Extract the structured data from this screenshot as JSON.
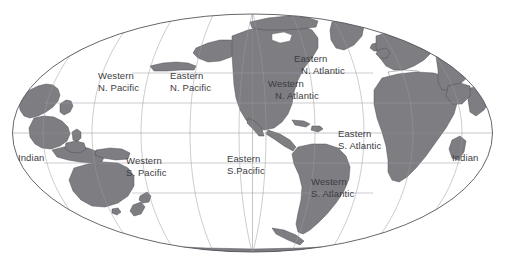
{
  "figure": {
    "type": "world-map",
    "projection": "mollweide-elliptical",
    "center_longitude_deg": -150,
    "background_color": "#ffffff",
    "land_color": "#7d7d82",
    "land_outline_color": "#4a4a50",
    "graticule_color": "#9a9aa0",
    "ellipse_outline_color": "#55555c",
    "label_color": "#3c3c41",
    "graticule": {
      "longitude_step_deg": 30,
      "latitude_step_deg": 30,
      "latitudes": [
        -60,
        -30,
        0,
        30,
        60
      ],
      "longitudes": [
        -180,
        -150,
        -120,
        -90,
        -60,
        -30,
        0,
        30,
        60,
        90,
        120,
        150,
        180
      ]
    }
  },
  "labels": [
    {
      "id": "western-n-pacific",
      "name": "Western N. Pacific",
      "line1": "Western",
      "line2": "N. Pacific",
      "x": 98,
      "y": 70
    },
    {
      "id": "eastern-n-pacific",
      "name": "Eastern N. Pacific",
      "line1": "Eastern",
      "line2": "N. Pacific",
      "x": 170,
      "y": 70
    },
    {
      "id": "eastern-n-atlantic",
      "name": "Eastern N. Atlantic",
      "line1": "Eastern",
      "line2": "N. Atlantic",
      "x": 294,
      "y": 53
    },
    {
      "id": "western-n-atlantic",
      "name": "Western N. Atlantic",
      "line1": "Western",
      "line2": "N. Atlantic",
      "x": 268,
      "y": 78
    },
    {
      "id": "indian-west",
      "name": "Indian",
      "line1": "Indian",
      "line2": "",
      "x": 18,
      "y": 152
    },
    {
      "id": "western-s-pacific",
      "name": "Western S. Pacific",
      "line1": "Western",
      "line2": "S. Pacific",
      "x": 126,
      "y": 155
    },
    {
      "id": "eastern-s-pacific",
      "name": "Eastern S.Pacific",
      "line1": "Eastern",
      "line2": "S.Pacific",
      "x": 227,
      "y": 153
    },
    {
      "id": "eastern-s-atlantic",
      "name": "Eastern S. Atlantic",
      "line1": "Eastern",
      "line2": "S. Atlantic",
      "x": 338,
      "y": 128
    },
    {
      "id": "western-s-atlantic",
      "name": "Western S. Atlantic",
      "line1": "Western",
      "line2": "S. Atlantic",
      "x": 311,
      "y": 176
    },
    {
      "id": "indian-east",
      "name": "Indian",
      "line1": "Indian",
      "line2": "",
      "x": 452,
      "y": 152
    }
  ]
}
